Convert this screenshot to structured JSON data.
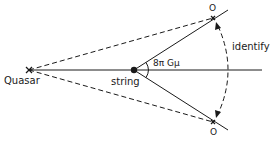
{
  "diagram": {
    "labels": {
      "quasar": "Quasar",
      "string": "string",
      "angle": "8π Gμ",
      "identify": "identify",
      "observer_top": "O",
      "observer_bottom": "O"
    },
    "colors": {
      "line": "#1a1a1a",
      "background": "#ffffff"
    },
    "elements": {
      "quasar": "cross-marker",
      "string": "filled-circle",
      "observers": "cross-markers",
      "identify_arc": "dashed double-headed arrow arc"
    }
  }
}
